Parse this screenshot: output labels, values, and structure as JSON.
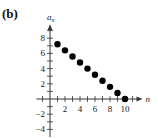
{
  "panel_label": "(b)",
  "chart_data": {
    "type": "scatter",
    "title": "",
    "xlabel": "n",
    "ylabel": "a_n",
    "x": [
      1,
      2,
      3,
      4,
      5,
      6,
      7,
      8,
      9,
      10
    ],
    "values": [
      7.2,
      6.4,
      5.6,
      4.8,
      4.0,
      3.2,
      2.4,
      1.6,
      0.8,
      0.0
    ],
    "x_ticks": [
      2,
      4,
      6,
      8,
      10
    ],
    "y_ticks": [
      -4,
      -2,
      2,
      4,
      6,
      8
    ],
    "xlim": [
      -2,
      12
    ],
    "ylim": [
      -5,
      9.5
    ],
    "grid": false,
    "legend": "none",
    "marker_color": "#000000"
  }
}
